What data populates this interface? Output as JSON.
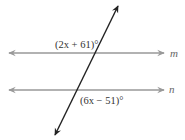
{
  "diagram": {
    "lines": {
      "m": {
        "label": "m"
      },
      "n": {
        "label": "n"
      },
      "transversal": {
        "label": ""
      }
    },
    "angles": {
      "top": {
        "label": "(2x + 61)°",
        "position": "above line m, left of transversal"
      },
      "bottom": {
        "label": "(6x − 51)°",
        "position": "below line n, right of transversal"
      }
    },
    "colors": {
      "parallel_lines": "#999999",
      "transversal": "#222222",
      "text": "#333333",
      "line_names": "#666666"
    }
  }
}
